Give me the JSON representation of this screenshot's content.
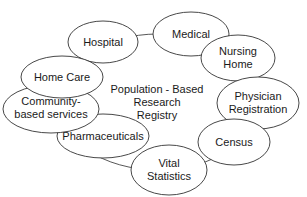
{
  "diagram": {
    "center": {
      "lines": [
        "Population - Based",
        "Research",
        "Registry"
      ]
    },
    "nodes": [
      {
        "id": "hospital",
        "lines": [
          "Hospital"
        ]
      },
      {
        "id": "medical",
        "lines": [
          "Medical"
        ]
      },
      {
        "id": "nursing-home",
        "lines": [
          "Nursing",
          "Home"
        ]
      },
      {
        "id": "physician-registration",
        "lines": [
          "Physician",
          "Registration"
        ]
      },
      {
        "id": "census",
        "lines": [
          "Census"
        ]
      },
      {
        "id": "vital-statistics",
        "lines": [
          "Vital",
          "Statistics"
        ]
      },
      {
        "id": "pharmaceuticals",
        "lines": [
          "Pharmaceuticals"
        ]
      },
      {
        "id": "community-based-services",
        "lines": [
          "Community-",
          "based services"
        ]
      },
      {
        "id": "home-care",
        "lines": [
          "Home Care"
        ]
      }
    ]
  }
}
